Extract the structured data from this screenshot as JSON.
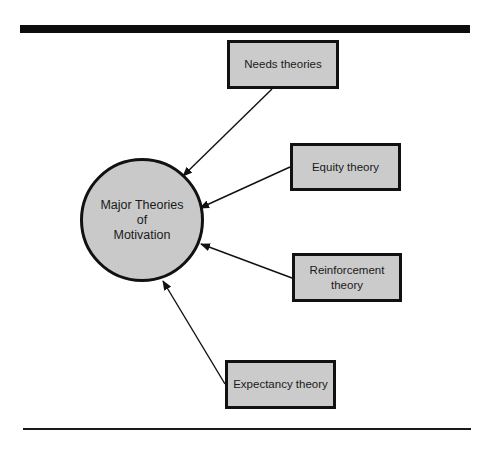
{
  "diagram": {
    "center": {
      "label_lines": [
        "Major Theories",
        "of",
        "Motivation"
      ]
    },
    "theories": [
      {
        "label_lines": [
          "Needs theories"
        ]
      },
      {
        "label_lines": [
          "Equity theory"
        ]
      },
      {
        "label_lines": [
          "Reinforcement",
          "theory"
        ]
      },
      {
        "label_lines": [
          "Expectancy theory"
        ]
      }
    ],
    "colors": {
      "box_fill": "#cbcbcb",
      "circle_fill": "#c9c9c9",
      "stroke": "#111111"
    }
  }
}
